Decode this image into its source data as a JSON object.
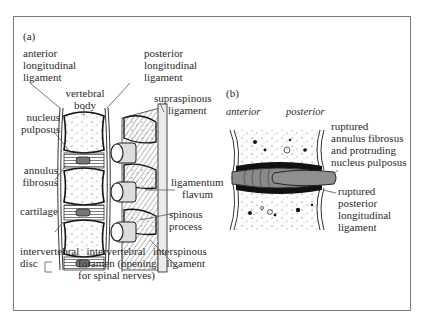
{
  "figure": {
    "panel_a": {
      "label": "(a)",
      "labels": {
        "anterior_longitudinal_ligament": [
          "anterior",
          "longitudinal",
          "ligament"
        ],
        "posterior_longitudinal_ligament": [
          "posterior",
          "longitudinal",
          "ligament"
        ],
        "vertebral_body": [
          "vertebral",
          "body"
        ],
        "supraspinous_ligament": [
          "supraspinous",
          "ligament"
        ],
        "nucleus_pulposus": [
          "nucleus",
          "pulposus"
        ],
        "annulus_fibrosus": [
          "annulus",
          "fibrosus"
        ],
        "ligamentum_flavum": [
          "ligamentum",
          "flavum"
        ],
        "cartilage": [
          "cartilage"
        ],
        "spinous_process": [
          "spinous",
          "process"
        ],
        "intervertebral_disc": [
          "intervertebral",
          "disc"
        ],
        "intervertebral_foramen": [
          "intervertebral",
          "foramen (opening",
          "for spinal nerves)"
        ],
        "interspinous_ligament": [
          "interspinous",
          "ligament"
        ]
      }
    },
    "panel_b": {
      "label": "(b)",
      "orientation": {
        "anterior": "anterior",
        "posterior": "posterior"
      },
      "labels": {
        "ruptured_annulus": [
          "ruptured",
          "annulus fibrosus",
          "and protruding",
          "nucleus pulposus"
        ],
        "ruptured_posterior_ligament": [
          "ruptured",
          "posterior",
          "longitudinal",
          "ligament"
        ]
      }
    },
    "colors": {
      "frame": "#7a7a7a",
      "ink": "#222222",
      "disc_fill": "#8a8a8a",
      "bone_fill": "#ffffff",
      "ligament_fill": "#e8e8e8"
    }
  }
}
